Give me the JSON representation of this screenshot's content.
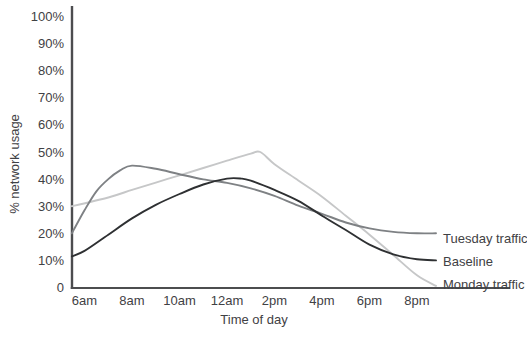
{
  "chart_data": {
    "type": "line",
    "title": "",
    "xlabel": "Time of day",
    "ylabel": "% network usage",
    "x_tick_labels": [
      "6am",
      "8am",
      "10am",
      "12am",
      "2pm",
      "4pm",
      "6pm",
      "8pm"
    ],
    "x_tick_hours": [
      6,
      8,
      10,
      12,
      14,
      16,
      18,
      20
    ],
    "y_tick_labels": [
      "100%",
      "90%",
      "80%",
      "70%",
      "60%",
      "50%",
      "40%",
      "30%",
      "20%",
      "10%",
      "0"
    ],
    "y_tick_values": [
      100,
      90,
      80,
      70,
      60,
      50,
      40,
      30,
      20,
      10,
      0
    ],
    "ylim": [
      0,
      100
    ],
    "xlim_hours": [
      5.47,
      20.8
    ],
    "grid": false,
    "legend_position": "line-end-labels-right",
    "axis_color": "#4c4d4f",
    "text_color": "#3f4144",
    "background_color": "#ffffff",
    "series": [
      {
        "name": "Tuesday traffic",
        "color": "#7e8184",
        "points": [
          [
            5.47,
            20
          ],
          [
            6,
            28.5
          ],
          [
            6.5,
            35.5
          ],
          [
            7,
            40
          ],
          [
            7.5,
            43.2
          ],
          [
            8,
            45
          ],
          [
            9,
            43.8
          ],
          [
            10,
            41.8
          ],
          [
            11,
            39.9
          ],
          [
            12,
            38.6
          ],
          [
            13,
            36.6
          ],
          [
            14,
            33.8
          ],
          [
            15,
            30.2
          ],
          [
            16,
            27.2
          ],
          [
            17,
            24
          ],
          [
            18,
            21.8
          ],
          [
            19,
            20.5
          ],
          [
            20,
            20
          ],
          [
            20.8,
            20
          ]
        ]
      },
      {
        "name": "Baseline",
        "color": "#2e3032",
        "points": [
          [
            5.47,
            11.5
          ],
          [
            6,
            13.5
          ],
          [
            7,
            19.5
          ],
          [
            8,
            25.5
          ],
          [
            9,
            30.5
          ],
          [
            10,
            34.5
          ],
          [
            11,
            38
          ],
          [
            12,
            40.2
          ],
          [
            12.6,
            40.2
          ],
          [
            13,
            39.4
          ],
          [
            14,
            36
          ],
          [
            15,
            32
          ],
          [
            16,
            26.5
          ],
          [
            17,
            21.2
          ],
          [
            18,
            15.8
          ],
          [
            19,
            12.2
          ],
          [
            20,
            10.4
          ],
          [
            20.8,
            10
          ]
        ]
      },
      {
        "name": "Monday traffic",
        "color": "#c6c7c8",
        "points": [
          [
            5.47,
            30
          ],
          [
            7,
            33.2
          ],
          [
            8,
            36
          ],
          [
            9,
            38.7
          ],
          [
            10,
            41.4
          ],
          [
            11,
            44.1
          ],
          [
            12,
            46.8
          ],
          [
            13,
            49.4
          ],
          [
            13.4,
            50
          ],
          [
            14,
            45.5
          ],
          [
            15,
            39.5
          ],
          [
            16,
            33.5
          ],
          [
            17,
            26.5
          ],
          [
            18,
            19.5
          ],
          [
            19,
            12
          ],
          [
            20,
            4.5
          ],
          [
            20.8,
            0.6
          ]
        ]
      }
    ]
  }
}
